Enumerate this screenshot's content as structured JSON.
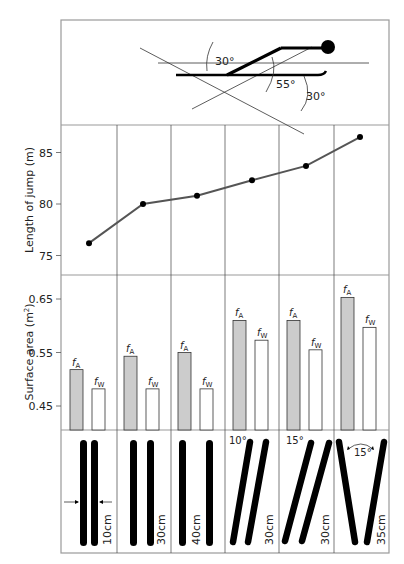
{
  "figure": {
    "top_panel": {
      "description": "Ski jumper body/ski angle diagram",
      "angle_labels": [
        "30°",
        "55°",
        "30°"
      ]
    },
    "columns": [
      {
        "style": "parallel",
        "spacing": "10cm",
        "angle": ""
      },
      {
        "style": "parallel",
        "spacing": "30cm",
        "angle": ""
      },
      {
        "style": "parallel",
        "spacing": "40cm",
        "angle": ""
      },
      {
        "style": "parallel-tilted",
        "spacing": "30cm",
        "angle": "10°"
      },
      {
        "style": "parallel-tilted",
        "spacing": "30cm",
        "angle": "15°"
      },
      {
        "style": "V-style",
        "spacing": "35cm",
        "angle": "15°"
      }
    ],
    "bar_labels": {
      "fA": "f",
      "fA_sub": "A",
      "fW": "f",
      "fW_sub": "W"
    }
  },
  "chart_data": [
    {
      "type": "line",
      "title": "",
      "xlabel": "",
      "ylabel": "Length of jump (m)",
      "categories": [
        "10cm parallel",
        "30cm parallel",
        "40cm parallel",
        "10° 30cm",
        "15° 30cm",
        "V 15° 35cm"
      ],
      "values": [
        76.2,
        80.0,
        80.8,
        82.3,
        83.7,
        86.5
      ],
      "yticks": [
        75,
        80,
        85
      ],
      "ytick_labels": [
        "75",
        "80",
        "85"
      ],
      "ylim": [
        73,
        88
      ],
      "grid": "vertical column dividers",
      "color": "#555555"
    },
    {
      "type": "bar",
      "title": "",
      "xlabel": "",
      "ylabel": "Surface area (m²)",
      "ylabel_text": "Surface area (m",
      "ylabel_sup": "2",
      "ylabel_close": ")",
      "categories": [
        "10cm parallel",
        "30cm parallel",
        "40cm parallel",
        "10° 30cm",
        "15° 30cm",
        "V 15° 35cm"
      ],
      "series": [
        {
          "name": "fA",
          "values": [
            0.518,
            0.543,
            0.55,
            0.61,
            0.61,
            0.653
          ],
          "color": "#cccccc"
        },
        {
          "name": "fW",
          "values": [
            0.482,
            0.482,
            0.482,
            0.573,
            0.555,
            0.597
          ],
          "color": "#ffffff"
        }
      ],
      "yticks": [
        0.45,
        0.55,
        0.65
      ],
      "ytick_labels": [
        "0.45",
        "0.55",
        "0.65"
      ],
      "ylim": [
        0.405,
        0.695
      ],
      "legend": "inline labels above bars"
    }
  ]
}
